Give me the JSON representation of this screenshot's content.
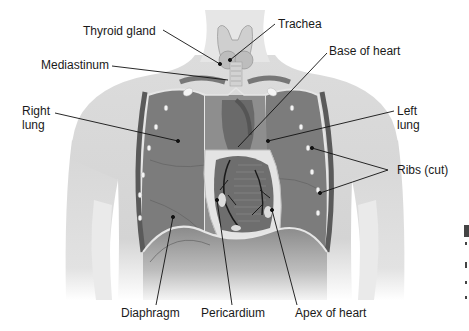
{
  "diagram": {
    "labels": {
      "thyroid_gland": "Thyroid gland",
      "trachea": "Trachea",
      "mediastinum": "Mediastinum",
      "base_of_heart": "Base of heart",
      "right_lung": "Right lung",
      "left_lung": "Left lung",
      "ribs_cut": "Ribs (cut)",
      "diaphragm": "Diaphragm",
      "pericardium": "Pericardium",
      "apex_of_heart": "Apex of heart"
    },
    "colors": {
      "skin": "#d9d9d9",
      "skin_light": "#ebebeb",
      "lung": "#7a7a7a",
      "lung_dark": "#5e5e5e",
      "pleura_line": "#e6e6e6",
      "heart": "#6b6b6b",
      "pericardium": "#e4e4e4",
      "rib": "#f4f4f4",
      "leader_line": "#111111",
      "text": "#1a1a1a"
    }
  }
}
